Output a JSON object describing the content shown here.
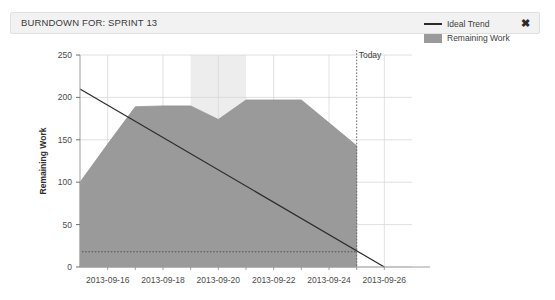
{
  "panel": {
    "title": "BURNDOWN FOR: SPRINT 13",
    "close_label": "✖"
  },
  "legend": {
    "items": [
      {
        "label": "Ideal Trend",
        "type": "line",
        "color": "#2a2a2a"
      },
      {
        "label": "Remaining Work",
        "type": "area",
        "color": "#9a9a9a"
      }
    ]
  },
  "annotations": {
    "today_label": "Today"
  },
  "chart_data": {
    "type": "area",
    "title": "BURNDOWN FOR: SPRINT 13",
    "xlabel": "",
    "ylabel": "Remaining Work",
    "ylim": [
      0,
      250
    ],
    "ytick_values": [
      0,
      50,
      100,
      150,
      200,
      250
    ],
    "ytick_labels": [
      "0",
      "50",
      "100",
      "150",
      "200",
      "250"
    ],
    "xlim": [
      "2013-09-15",
      "2013-09-27"
    ],
    "xtick_labels": [
      "2013-09-16",
      "2013-09-18",
      "2013-09-20",
      "2013-09-22",
      "2013-09-24",
      "2013-09-26"
    ],
    "xtick_dates": [
      "2013-09-16",
      "2013-09-18",
      "2013-09-20",
      "2013-09-22",
      "2013-09-24",
      "2013-09-26"
    ],
    "grid": true,
    "legend_position": "right",
    "series": [
      {
        "name": "Remaining Work",
        "type": "area",
        "color": "#9a9a9a",
        "x": [
          "2013-09-15",
          "2013-09-16",
          "2013-09-17",
          "2013-09-18",
          "2013-09-19",
          "2013-09-20",
          "2013-09-21",
          "2013-09-22",
          "2013-09-23",
          "2013-09-24",
          "2013-09-25"
        ],
        "values": [
          100,
          145,
          189,
          190,
          190,
          174,
          197,
          197,
          197,
          170,
          143
        ]
      },
      {
        "name": "Ideal Trend",
        "type": "line",
        "color": "#2a2a2a",
        "x": [
          "2013-09-15",
          "2013-09-26"
        ],
        "values": [
          210,
          0
        ]
      }
    ],
    "annotations": [
      {
        "name": "today-line",
        "label": "Today",
        "x": "2013-09-25",
        "style": "dotted-vertical"
      },
      {
        "name": "threshold-line",
        "label": "",
        "y": 18,
        "style": "dotted-horizontal"
      },
      {
        "name": "weekend-band",
        "label": "",
        "x_start": "2013-09-19",
        "x_end": "2013-09-21",
        "style": "shaded-band"
      }
    ]
  }
}
